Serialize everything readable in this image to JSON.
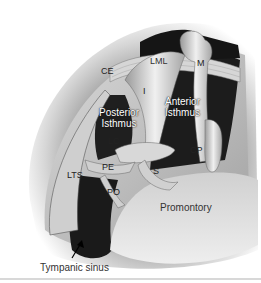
{
  "figure": {
    "labels": {
      "lml": "LML",
      "m": "M",
      "ce": "CE",
      "i": "I",
      "posterior_isthmus_1": "Posterior",
      "posterior_isthmus_2": "Isthmus",
      "anterior_isthmus_1": "Anterior",
      "anterior_isthmus_2": "Isthmus",
      "lc": "LC",
      "cp": "CP",
      "pe": "PE",
      "s": "S",
      "lts": "LTS",
      "po": "PO",
      "promontory": "Promontory",
      "tympanic_sinus": "Tympanic sinus"
    },
    "colors": {
      "background": "#ffffff",
      "shadow_dark": "#1e1e1e",
      "bone_light": "#e6e6e6",
      "bone_mid": "#bdbdbd"
    }
  }
}
